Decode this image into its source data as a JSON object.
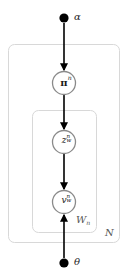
{
  "diagram": {
    "type": "plate-notation-graphical-model",
    "canvas": {
      "width": 128,
      "height": 280,
      "background": "#ffffff"
    },
    "colors": {
      "node_stroke": "#808080",
      "node_fill": "#ffffff",
      "observed_fill": "#000000",
      "edge": "#000000",
      "plate_stroke": "#d8d8d8",
      "text": "#1a1a1a",
      "plate_label_text": "#555555"
    },
    "nodes": [
      {
        "id": "alpha",
        "kind": "filled-dot",
        "label": "α",
        "label_position": "right",
        "cx": 64,
        "cy": 18,
        "r": 4.5
      },
      {
        "id": "pi_n",
        "kind": "circle",
        "base": "π",
        "superscript": "n",
        "subscript": "",
        "cx": 64,
        "cy": 83,
        "r": 12
      },
      {
        "id": "z_w_n",
        "kind": "circle",
        "base": "z",
        "superscript": "n",
        "subscript": "w",
        "cx": 64,
        "cy": 142,
        "r": 12
      },
      {
        "id": "v_w_n",
        "kind": "circle",
        "base": "v",
        "superscript": "n",
        "subscript": "w",
        "cx": 64,
        "cy": 202,
        "r": 12
      },
      {
        "id": "theta",
        "kind": "filled-dot",
        "label": "θ",
        "label_position": "right",
        "cx": 64,
        "cy": 263,
        "r": 4.5
      }
    ],
    "edges": [
      {
        "id": "alpha-to-pi",
        "from": "alpha",
        "to": "pi_n",
        "x": 64,
        "y1": 23,
        "y2": 70,
        "direction": "down"
      },
      {
        "id": "pi-to-z",
        "from": "pi_n",
        "to": "z_w_n",
        "x": 64,
        "y1": 95,
        "y2": 129,
        "direction": "down"
      },
      {
        "id": "z-to-v",
        "from": "z_w_n",
        "to": "v_w_n",
        "x": 64,
        "y1": 154,
        "y2": 189,
        "direction": "down"
      },
      {
        "id": "theta-to-v",
        "from": "theta",
        "to": "v_w_n",
        "x": 64,
        "y1": 258,
        "y2": 215,
        "direction": "up"
      }
    ],
    "plates": [
      {
        "id": "outer-plate",
        "label": "N",
        "x": 8,
        "y": 44,
        "width": 112,
        "height": 199,
        "rx": 6,
        "label_x": 105,
        "label_y": 228
      },
      {
        "id": "inner-plate",
        "label": "W",
        "label_subscript": "n",
        "x": 32,
        "y": 110,
        "width": 65,
        "height": 123,
        "rx": 6,
        "label_x": 76,
        "label_y": 215
      }
    ]
  }
}
